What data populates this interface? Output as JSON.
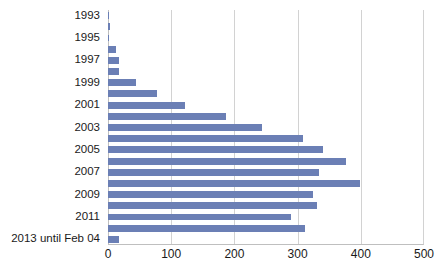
{
  "chart_data": {
    "type": "bar",
    "orientation": "horizontal",
    "title": "",
    "subtitle": "",
    "xlabel": "",
    "ylabel": "",
    "xlim": [
      0,
      500
    ],
    "xticks": [
      0,
      100,
      200,
      300,
      400,
      500
    ],
    "xtick_labels": [
      "0",
      "100",
      "200",
      "300",
      "400",
      "500"
    ],
    "grid": true,
    "grid_axis": "x",
    "legend": false,
    "legend_position": "none",
    "bar_color": "#6b7fb5",
    "gridline_color": "#d2d2d2",
    "axis_color": "#bfbfbf",
    "text_color": "#1a1a1a",
    "background": "#ffffff",
    "categories": [
      "1993",
      "1994",
      "1995",
      "1996",
      "1997",
      "1998",
      "1999",
      "2000",
      "2001",
      "2002",
      "2003",
      "2004",
      "2005",
      "2006",
      "2007",
      "2008",
      "2009",
      "2010",
      "2011",
      "2012",
      "2013 until Feb 04"
    ],
    "visible_tick_labels": [
      "1993",
      "1995",
      "1997",
      "1999",
      "2001",
      "2003",
      "2005",
      "2007",
      "2009",
      "2011",
      "2013 until Feb 04"
    ],
    "values": [
      2,
      3,
      2,
      12,
      17,
      18,
      45,
      78,
      122,
      186,
      243,
      308,
      340,
      376,
      334,
      398,
      324,
      330,
      290,
      312,
      18
    ]
  }
}
